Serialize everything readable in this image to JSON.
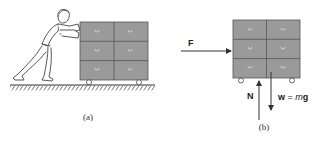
{
  "figure": {
    "panel_a": {
      "caption": "(a)",
      "description": "person pushing filing cabinet on wheels across hatched floor"
    },
    "panel_b": {
      "caption": "(b)",
      "forces": {
        "applied": {
          "label": "F",
          "direction": "right"
        },
        "normal": {
          "label": "N",
          "direction": "up"
        },
        "weight": {
          "label_w": "w",
          "label_eq": " = ",
          "label_m": "m",
          "label_g": "g",
          "direction": "down"
        }
      }
    },
    "colors": {
      "cabinet_fill": "#9a9a9a",
      "cabinet_stroke": "#555555",
      "line": "#333333"
    }
  }
}
